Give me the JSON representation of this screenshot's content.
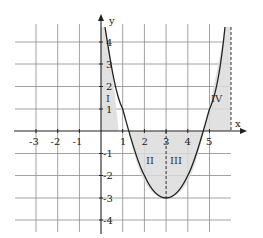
{
  "figure": {
    "function": "y = x^2 - 6x + 6",
    "axes": {
      "x_label": "x",
      "y_label": "y",
      "x_ticks": [
        "-3",
        "-2",
        "-1",
        "1",
        "2",
        "3",
        "4",
        "5"
      ],
      "y_ticks": [
        "4",
        "3",
        "2",
        "1",
        "-1",
        "-2",
        "-3",
        "-4"
      ]
    },
    "regions": [
      {
        "label": "I",
        "x_range": [
          0,
          1.27
        ]
      },
      {
        "label": "II",
        "x_range": [
          1.27,
          3
        ]
      },
      {
        "label": "III",
        "x_range": [
          3,
          4.73
        ]
      },
      {
        "label": "IV",
        "x_range": [
          4.73,
          6
        ]
      }
    ],
    "dashed_lines_x": [
      3,
      6
    ],
    "colors": {
      "shade": "#dcdcdc",
      "grid": "#888888",
      "curve": "#222222",
      "axis": "#222222"
    }
  }
}
